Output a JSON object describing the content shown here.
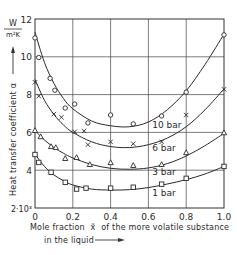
{
  "chart_data": {
    "type": "scatter",
    "title": "",
    "xlabel": "Mole fraction x̃ of the more volatile substance in the liquid",
    "xlabel_line1": "Mole fraction",
    "xlabel_xsym": "x̃",
    "xlabel_line1_rest": "of the more volatile substance",
    "xlabel_line2": "in the liquid",
    "ylabel": "Heat transfer coefficient α",
    "yunit_num": "W",
    "yunit_den": "m²K",
    "xlim": [
      0,
      1.0
    ],
    "ylim": [
      2000,
      12000
    ],
    "y_scale_note": "2·10³",
    "x_ticks": [
      "0",
      "0.2",
      "0.4",
      "0.6",
      "0.8",
      "1.0"
    ],
    "y_ticks": [
      "2·10³",
      "4",
      "6",
      "8",
      "10",
      "12"
    ],
    "grid": true,
    "series": [
      {
        "name": "10 bar",
        "marker": "circle",
        "x": [
          0.0,
          0.02,
          0.08,
          0.105,
          0.16,
          0.21,
          0.28,
          0.4,
          0.52,
          0.67,
          0.8,
          1.0
        ],
        "y": [
          11.0,
          9.96,
          8.86,
          8.23,
          7.29,
          7.5,
          6.5,
          6.92,
          6.45,
          6.87,
          8.13,
          11.16
        ],
        "curve": [
          [
            0,
            11.3
          ],
          [
            0.05,
            9.7
          ],
          [
            0.1,
            8.6
          ],
          [
            0.15,
            7.8
          ],
          [
            0.2,
            7.25
          ],
          [
            0.3,
            6.6
          ],
          [
            0.4,
            6.35
          ],
          [
            0.5,
            6.3
          ],
          [
            0.6,
            6.55
          ],
          [
            0.7,
            7.2
          ],
          [
            0.8,
            8.2
          ],
          [
            0.9,
            9.6
          ],
          [
            1.0,
            11.2
          ]
        ]
      },
      {
        "name": "6 bar",
        "marker": "cross",
        "x": [
          0.0,
          0.02,
          0.1,
          0.14,
          0.21,
          0.26,
          0.28,
          0.4,
          0.52,
          0.67,
          0.8,
          1.0
        ],
        "y": [
          8.65,
          7.92,
          6.97,
          6.8,
          6.03,
          6.08,
          5.35,
          5.5,
          5.4,
          5.5,
          6.92,
          8.28
        ],
        "curve": [
          [
            0,
            8.8
          ],
          [
            0.05,
            7.7
          ],
          [
            0.1,
            6.95
          ],
          [
            0.15,
            6.4
          ],
          [
            0.2,
            6.0
          ],
          [
            0.3,
            5.5
          ],
          [
            0.4,
            5.25
          ],
          [
            0.5,
            5.2
          ],
          [
            0.6,
            5.35
          ],
          [
            0.7,
            5.7
          ],
          [
            0.8,
            6.3
          ],
          [
            0.9,
            7.2
          ],
          [
            1.0,
            8.3
          ]
        ]
      },
      {
        "name": "3 bar",
        "marker": "triangle",
        "x": [
          0.0,
          0.03,
          0.085,
          0.11,
          0.16,
          0.22,
          0.29,
          0.4,
          0.52,
          0.67,
          0.8,
          1.0
        ],
        "y": [
          6.1,
          5.77,
          5.25,
          5.2,
          4.62,
          4.67,
          4.3,
          4.4,
          4.25,
          4.3,
          4.93,
          5.98
        ],
        "curve": [
          [
            0,
            6.1
          ],
          [
            0.05,
            5.6
          ],
          [
            0.1,
            5.2
          ],
          [
            0.15,
            4.9
          ],
          [
            0.2,
            4.65
          ],
          [
            0.3,
            4.3
          ],
          [
            0.4,
            4.1
          ],
          [
            0.5,
            4.05
          ],
          [
            0.6,
            4.12
          ],
          [
            0.7,
            4.35
          ],
          [
            0.8,
            4.75
          ],
          [
            0.9,
            5.3
          ],
          [
            1.0,
            5.95
          ]
        ]
      },
      {
        "name": "1 bar",
        "marker": "square",
        "x": [
          0.0,
          0.02,
          0.085,
          0.16,
          0.22,
          0.27,
          0.4,
          0.52,
          0.67,
          0.8,
          1.0
        ],
        "y": [
          4.83,
          4.41,
          3.89,
          3.36,
          3.0,
          3.05,
          3.05,
          3.1,
          3.26,
          3.57,
          4.2
        ],
        "curve": [
          [
            0,
            4.85
          ],
          [
            0.05,
            4.2
          ],
          [
            0.1,
            3.75
          ],
          [
            0.15,
            3.45
          ],
          [
            0.2,
            3.22
          ],
          [
            0.3,
            3.0
          ],
          [
            0.4,
            2.95
          ],
          [
            0.5,
            2.97
          ],
          [
            0.6,
            3.08
          ],
          [
            0.7,
            3.27
          ],
          [
            0.8,
            3.5
          ],
          [
            0.9,
            3.8
          ],
          [
            1.0,
            4.2
          ]
        ]
      }
    ],
    "annotations": [
      {
        "text": "10 bar",
        "x": 0.62,
        "y": 6.25
      },
      {
        "text": "6 bar",
        "x": 0.62,
        "y": 5.0
      },
      {
        "text": "3 bar",
        "x": 0.62,
        "y": 3.75
      },
      {
        "text": "1 bar",
        "x": 0.62,
        "y": 2.65
      }
    ]
  }
}
